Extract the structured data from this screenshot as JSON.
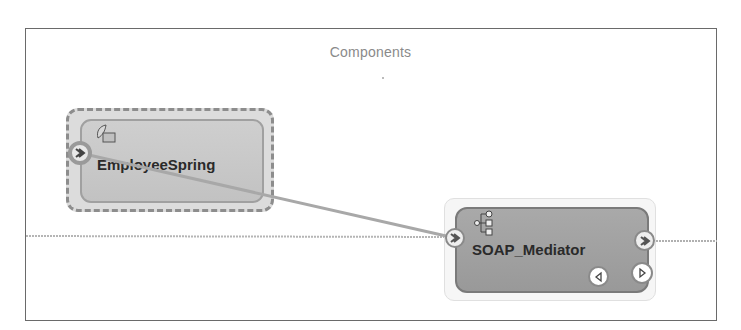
{
  "canvas": {
    "title": "Components"
  },
  "components": [
    {
      "id": "employee-spring",
      "label": "EmployeeSpring",
      "type": "spring-component",
      "icon": "spring-leaf-icon",
      "selected": true
    },
    {
      "id": "soap-mediator",
      "label": "SOAP_Mediator",
      "type": "mediator-component",
      "icon": "mediator-tree-icon",
      "selected": false
    }
  ],
  "wires": [
    {
      "from": "employee-spring.service-port",
      "to": "soap-mediator.service-port"
    }
  ],
  "ports": {
    "employee_spring_service": "service-port-chevron-right",
    "mediator_service": "service-port-chevron-right",
    "mediator_reference": "reference-port-chevron-right",
    "mediator_callback_left": "triangle-left",
    "mediator_callback_right": "triangle-right"
  },
  "colors": {
    "frame_border": "#6a6a6a",
    "title_text": "#8a8a8a",
    "wire": "#a8a8a8",
    "spring_fill": "#c8c8c8",
    "mediator_fill": "#a0a0a0"
  }
}
